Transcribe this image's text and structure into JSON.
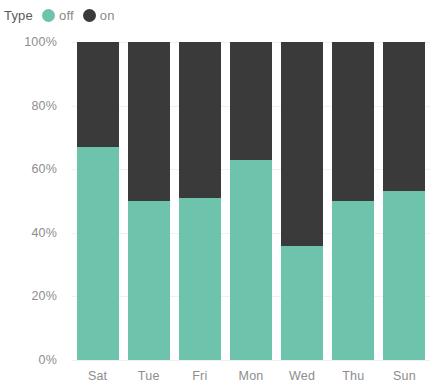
{
  "legend": {
    "title": "Type",
    "items": [
      {
        "label": "off",
        "color": "#6ec3ad",
        "icon": "circle-swatch-icon"
      },
      {
        "label": "on",
        "color": "#3a3a3a",
        "icon": "circle-swatch-icon"
      }
    ]
  },
  "axes": {
    "y_ticks": [
      "0%",
      "20%",
      "40%",
      "60%",
      "80%",
      "100%"
    ],
    "x_ticks": [
      "Sat",
      "Tue",
      "Fri",
      "Mon",
      "Wed",
      "Thu",
      "Sun"
    ]
  },
  "chart_data": {
    "type": "bar",
    "stacked": true,
    "stack_mode": "percent",
    "title": "",
    "xlabel": "",
    "ylabel": "",
    "ylim": [
      0,
      100
    ],
    "ytick_values": [
      0,
      20,
      40,
      60,
      80,
      100
    ],
    "ytick_labels": [
      "0%",
      "20%",
      "40%",
      "60%",
      "80%",
      "100%"
    ],
    "grid": true,
    "legend_title": "Type",
    "legend_position": "top-left",
    "categories": [
      "Sat",
      "Tue",
      "Fri",
      "Mon",
      "Wed",
      "Thu",
      "Sun"
    ],
    "series": [
      {
        "name": "off",
        "color": "#6ec3ad",
        "values": [
          67,
          50,
          51,
          63,
          36,
          50,
          53
        ]
      },
      {
        "name": "on",
        "color": "#3a3a3a",
        "values": [
          33,
          50,
          49,
          37,
          64,
          50,
          47
        ]
      }
    ]
  }
}
